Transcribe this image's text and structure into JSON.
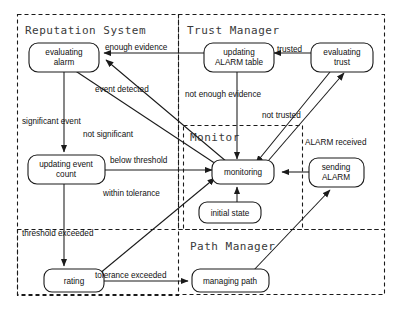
{
  "diagram": {
    "type": "state-machine",
    "regions": [
      {
        "id": "reputation-system",
        "label": "Reputation System",
        "x": 17,
        "y": 14,
        "w": 161,
        "h": 281
      },
      {
        "id": "trust-manager",
        "label": "Trust Manager",
        "x": 178,
        "y": 14,
        "w": 207,
        "h": 216
      },
      {
        "id": "monitor",
        "label": "Monitor",
        "x": 183,
        "y": 125,
        "w": 120,
        "h": 105
      },
      {
        "id": "path-manager",
        "label": "Path Manager",
        "x": 17,
        "y": 230,
        "w": 368,
        "h": 65
      }
    ],
    "states": [
      {
        "id": "evaluating-alarm",
        "label_line1": "evaluating",
        "label_line2": "alarm",
        "cx": 64,
        "cy": 57,
        "w": 70,
        "h": 28
      },
      {
        "id": "updating-alarm-table",
        "label_line1": "updating",
        "label_line2": "ALARM table",
        "cx": 237,
        "cy": 57,
        "w": 66,
        "h": 28
      },
      {
        "id": "evaluating-trust",
        "label_line1": "evaluating",
        "label_line2": "trust",
        "cx": 342,
        "cy": 57,
        "w": 62,
        "h": 28
      },
      {
        "id": "updating-event-count",
        "label_line1": "updating event",
        "label_line2": "count",
        "cx": 64,
        "cy": 170,
        "w": 82,
        "h": 28
      },
      {
        "id": "monitoring",
        "label_line1": "monitoring",
        "label_line2": "",
        "cx": 243,
        "cy": 172,
        "w": 62,
        "h": 22
      },
      {
        "id": "sending-alarm",
        "label_line1": "sending",
        "label_line2": "ALARM",
        "cx": 336,
        "cy": 172,
        "w": 54,
        "h": 28
      },
      {
        "id": "initial-state",
        "label_line1": "initial state",
        "label_line2": "",
        "cx": 229,
        "cy": 212,
        "w": 62,
        "h": 20
      },
      {
        "id": "rating",
        "label_line1": "rating",
        "label_line2": "",
        "cx": 74,
        "cy": 280,
        "w": 60,
        "h": 22
      },
      {
        "id": "managing-path",
        "label_line1": "managing path",
        "label_line2": "",
        "cx": 230,
        "cy": 280,
        "w": 76,
        "h": 22
      }
    ],
    "transitions": [
      {
        "id": "t-enough-evidence",
        "from": "updating-alarm-table",
        "to": "evaluating-alarm",
        "label": "enough evidence",
        "label_x": 106,
        "label_y": 48
      },
      {
        "id": "t-trusted",
        "from": "evaluating-trust",
        "to": "updating-alarm-table",
        "label": "trusted",
        "label_x": 281,
        "label_y": 52
      },
      {
        "id": "t-event-detected",
        "from": "monitoring",
        "to": "evaluating-alarm",
        "label": "event  detected",
        "label_x": 98,
        "label_y": 90
      },
      {
        "id": "t-not-enough-evidence",
        "from": "updating-alarm-table",
        "to": "monitoring",
        "label": "not enough  evidence",
        "label_x": 184,
        "label_y": 97
      },
      {
        "id": "t-not-trusted",
        "from": "evaluating-trust",
        "to": "monitoring",
        "label": "not trusted",
        "label_x": 258,
        "label_y": 116
      },
      {
        "id": "t-alarm-received",
        "from": "sending-alarm",
        "to": "monitoring",
        "label": "ALARM  received",
        "label_x": 306,
        "label_y": 138
      },
      {
        "id": "t-significant-event",
        "from": "evaluating-alarm",
        "to": "updating-event-count",
        "label": "significant  event",
        "label_x": 26,
        "label_y": 123
      },
      {
        "id": "t-not-significant",
        "from": "evaluating-alarm",
        "to": "monitoring",
        "label": "not significant",
        "label_x": 84,
        "label_y": 137
      },
      {
        "id": "t-below-threshold",
        "from": "updating-event-count",
        "to": "monitoring",
        "label": "below threshold",
        "label_x": 112,
        "label_y": 164
      },
      {
        "id": "t-within-tolerance",
        "from": "rating",
        "to": "monitoring",
        "label": "within tolerance",
        "label_x": 104,
        "label_y": 195
      },
      {
        "id": "t-threshold-exceeded",
        "from": "updating-event-count",
        "to": "rating",
        "label": "threshold  exceeded",
        "label_x": 24,
        "label_y": 237
      },
      {
        "id": "t-tolerance-exceeded",
        "from": "rating",
        "to": "managing-path",
        "label": "tolerance exceeded",
        "label_x": 96,
        "label_y": 277
      },
      {
        "id": "t-start",
        "from": "initial-state",
        "to": "monitoring",
        "label": "",
        "label_x": 0,
        "label_y": 0
      },
      {
        "id": "t-managing-to-sending",
        "from": "managing-path",
        "to": "sending-alarm",
        "label": "",
        "label_x": 0,
        "label_y": 0
      },
      {
        "id": "t-monitoring-to-trust",
        "from": "monitoring",
        "to": "evaluating-trust",
        "label": "",
        "label_x": 0,
        "label_y": 0
      }
    ],
    "colors": {
      "background": "#ffffff",
      "stroke": "#1a1a1a",
      "region_title": "#3a3a3a"
    }
  }
}
